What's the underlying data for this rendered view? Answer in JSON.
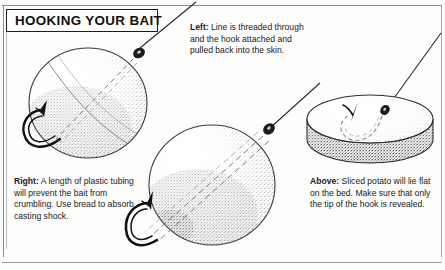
{
  "page": {
    "title": "HOOKING YOUR BAIT",
    "background_color": "#fdfdfc",
    "ink_color": "#1a1a1a",
    "frame_color": "#8e8e8e"
  },
  "captions": {
    "left": {
      "lead": "Left:",
      "body": " Line is threaded through and the hook attached and pulled back into the skin."
    },
    "right": {
      "lead": "Right:",
      "body": " A length of plastic tubing will prevent the bait from crumbling. Use bread to absorb casting shock."
    },
    "above": {
      "lead": "Above:",
      "body": " Sliced potato will lie flat on the bed. Make sure that only the tip of the hook is revealed."
    }
  },
  "illustrations": [
    {
      "name": "boilie-bait-ball-left",
      "description": "Round stippled bait ball with fishing line entering at top right through a knot bead, dashed internal line showing hook shank, and hook emerging at lower left",
      "parts": [
        "fishing-line",
        "knot-bead",
        "bait-ball",
        "dashed-internal-line",
        "hook",
        "hook-barb"
      ]
    },
    {
      "name": "bait-ball-with-tubing-centre",
      "description": "Larger round stippled bait ball with plastic tubing drawn as double dashed lines running diagonally through the bait to the hook at lower left",
      "parts": [
        "fishing-line",
        "knot-bead",
        "bait-ball",
        "plastic-tubing-dashed",
        "hook",
        "hook-barb"
      ]
    },
    {
      "name": "sliced-potato-right",
      "description": "Flat disc of sliced potato lying on the bed with a hook buried inside, dashed line showing the concealed bend and only the hook point revealed",
      "parts": [
        "fishing-line",
        "knot-bead",
        "potato-slice",
        "dashed-buried-hook",
        "hook-point"
      ]
    }
  ]
}
